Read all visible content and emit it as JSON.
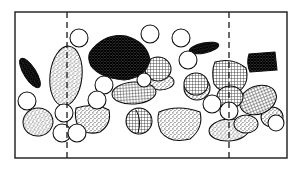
{
  "figure": {
    "background_color": "#ffffff",
    "ink_color": "#0d0d0d"
  },
  "frame": {
    "name": "section-frame",
    "x": 15,
    "y": 12,
    "width": 272,
    "height": 146,
    "stroke_color": "#1a1a1a",
    "stroke_width": 1.4
  },
  "dividers": [
    {
      "name": "left-divider",
      "x": 67,
      "y1": 12,
      "y2": 158,
      "style": "dashed"
    },
    {
      "name": "right-divider",
      "x": 229,
      "y1": 12,
      "y2": 158,
      "style": "dashed"
    }
  ],
  "textures": {
    "dark_mesh": {
      "label": "dark cross-hatch",
      "color": "#2a2a2a",
      "density": "high"
    },
    "grid": {
      "label": "medium grid",
      "color": "#5a5a5a",
      "density": "medium"
    },
    "stipple": {
      "label": "fine stipple",
      "color": "#8a8a8a",
      "density": "low"
    },
    "open": {
      "label": "open white",
      "color": "#ffffff",
      "density": "none"
    }
  },
  "chart_data": {
    "type": "scatter",
    "xlabel": "",
    "ylabel": "",
    "xlim": [
      15,
      287
    ],
    "ylim": [
      12,
      158
    ],
    "grid": false,
    "legend": "none",
    "series": [
      {
        "name": "dark-mesh-clasts",
        "texture": "dark_mesh",
        "count": 4,
        "items": [
          {
            "id": "clast-dark-large-center",
            "cx": 119,
            "cy": 58,
            "rx": 31,
            "ry": 21,
            "rot": -8
          },
          {
            "id": "clast-dark-bar-left",
            "cx": 30,
            "cy": 73,
            "rx": 17,
            "ry": 6,
            "rot": 58
          },
          {
            "id": "clast-dark-bar-upper-right",
            "cx": 204,
            "cy": 48,
            "rx": 15,
            "ry": 5,
            "rot": -12
          },
          {
            "id": "clast-dark-block-right",
            "cx": 262,
            "cy": 62,
            "rx": 14,
            "ry": 9,
            "rot": -6
          }
        ]
      },
      {
        "name": "grid-texture-clasts",
        "texture": "grid",
        "count": 7,
        "items": [
          {
            "id": "clast-grid-midbar",
            "cx": 134,
            "cy": 93,
            "rx": 22,
            "ry": 11,
            "rot": -4
          },
          {
            "id": "clast-grid-round-upper",
            "cx": 158,
            "cy": 69,
            "rx": 13,
            "ry": 12,
            "rot": 0
          },
          {
            "id": "clast-grid-right-upper",
            "cx": 230,
            "cy": 77,
            "rx": 17,
            "ry": 16,
            "rot": 10
          },
          {
            "id": "clast-grid-right-mid",
            "cx": 258,
            "cy": 100,
            "rx": 19,
            "ry": 14,
            "rot": -22
          },
          {
            "id": "clast-grid-right-low",
            "cx": 230,
            "cy": 97,
            "rx": 13,
            "ry": 11,
            "rot": 0
          },
          {
            "id": "clast-grid-split",
            "cx": 139,
            "cy": 121,
            "rx": 13,
            "ry": 13,
            "rot": 0
          },
          {
            "id": "clast-grid-small-left",
            "cx": 196,
            "cy": 84,
            "rx": 12,
            "ry": 11,
            "rot": 0
          }
        ]
      },
      {
        "name": "stipple-clasts",
        "texture": "stipple",
        "count": 9,
        "items": [
          {
            "id": "clast-stipple-tall-left",
            "cx": 66,
            "cy": 76,
            "rx": 16,
            "ry": 30,
            "rot": 6
          },
          {
            "id": "clast-stipple-lower-left",
            "cx": 38,
            "cy": 122,
            "rx": 15,
            "ry": 14,
            "rot": -12
          },
          {
            "id": "clast-stipple-crescent",
            "cx": 92,
            "cy": 118,
            "rx": 17,
            "ry": 14,
            "rot": 0
          },
          {
            "id": "clast-stipple-basket",
            "cx": 180,
            "cy": 124,
            "rx": 22,
            "ry": 17,
            "rot": -6
          },
          {
            "id": "clast-stipple-right-low",
            "cx": 229,
            "cy": 130,
            "rx": 20,
            "ry": 11,
            "rot": -4
          },
          {
            "id": "clast-stipple-mid-right",
            "cx": 197,
            "cy": 88,
            "rx": 13,
            "ry": 12,
            "rot": 0
          },
          {
            "id": "clast-stipple-under-grid",
            "cx": 160,
            "cy": 82,
            "rx": 14,
            "ry": 8,
            "rot": 0
          },
          {
            "id": "clast-stipple-upper-right",
            "cx": 246,
            "cy": 124,
            "rx": 12,
            "ry": 9,
            "rot": 0
          },
          {
            "id": "clast-stipple-far-right",
            "cx": 272,
            "cy": 117,
            "rx": 11,
            "ry": 10,
            "rot": 0
          }
        ]
      },
      {
        "name": "open-void-circles",
        "texture": "open",
        "count": 14,
        "items": [
          {
            "id": "void-01",
            "cx": 79,
            "cy": 38,
            "r": 9
          },
          {
            "id": "void-02",
            "cx": 150,
            "cy": 34,
            "r": 9
          },
          {
            "id": "void-03",
            "cx": 181,
            "cy": 38,
            "r": 9
          },
          {
            "id": "void-04",
            "cx": 188,
            "cy": 60,
            "r": 9
          },
          {
            "id": "void-05",
            "cx": 104,
            "cy": 85,
            "r": 9
          },
          {
            "id": "void-06",
            "cx": 97,
            "cy": 100,
            "r": 9
          },
          {
            "id": "void-07",
            "cx": 27,
            "cy": 101,
            "r": 9
          },
          {
            "id": "void-08",
            "cx": 64,
            "cy": 113,
            "r": 9
          },
          {
            "id": "void-09",
            "cx": 62,
            "cy": 133,
            "r": 9
          },
          {
            "id": "void-10",
            "cx": 77,
            "cy": 133,
            "r": 9
          },
          {
            "id": "void-11",
            "cx": 212,
            "cy": 104,
            "r": 9
          },
          {
            "id": "void-12",
            "cx": 229,
            "cy": 111,
            "r": 9
          },
          {
            "id": "void-13",
            "cx": 276,
            "cy": 123,
            "r": 8
          },
          {
            "id": "void-14",
            "cx": 144,
            "cy": 80,
            "r": 7
          }
        ]
      }
    ]
  }
}
